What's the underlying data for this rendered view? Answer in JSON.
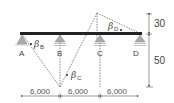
{
  "diagram": {
    "supports": [
      {
        "label": "A",
        "type": "pin"
      },
      {
        "label": "B",
        "type": "roller"
      },
      {
        "label": "C",
        "type": "roller"
      },
      {
        "label": "D",
        "type": "roller"
      }
    ],
    "angles": [
      {
        "symbol": "β",
        "subscript": "B"
      },
      {
        "symbol": "β",
        "subscript": "C"
      },
      {
        "symbol": "β",
        "subscript": "D"
      }
    ],
    "horizontal_dimensions": [
      "6,000",
      "6,000",
      "6,000"
    ],
    "vertical_dimensions": [
      "30",
      "50"
    ]
  }
}
